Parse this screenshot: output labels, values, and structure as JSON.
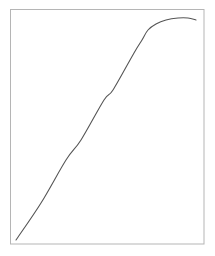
{
  "chart_data": {
    "type": "line",
    "title": "",
    "xlabel": "",
    "ylabel": "",
    "grid": false,
    "legend": null,
    "axis_ticks": "none",
    "description": "Single curve rising linearly from bottom-left, then bending over to a plateau with a slight drop near the right end",
    "series": [
      {
        "name": "curve",
        "color": "#555555",
        "points_px": [
          [
            16,
            240
          ],
          [
            41,
            203
          ],
          [
            66,
            160
          ],
          [
            81,
            140
          ],
          [
            104,
            100
          ],
          [
            113,
            90
          ],
          [
            134,
            53
          ],
          [
            142,
            40
          ],
          [
            148,
            30
          ],
          [
            156,
            24
          ],
          [
            166,
            20
          ],
          [
            178,
            18
          ],
          [
            188,
            18
          ],
          [
            196,
            20
          ]
        ],
        "points_normalized": [
          [
            0.03,
            0.02
          ],
          [
            0.16,
            0.17
          ],
          [
            0.29,
            0.36
          ],
          [
            0.36,
            0.44
          ],
          [
            0.48,
            0.61
          ],
          [
            0.53,
            0.66
          ],
          [
            0.63,
            0.82
          ],
          [
            0.68,
            0.87
          ],
          [
            0.71,
            0.91
          ],
          [
            0.75,
            0.94
          ],
          [
            0.8,
            0.96
          ],
          [
            0.86,
            0.97
          ],
          [
            0.91,
            0.97
          ],
          [
            0.95,
            0.96
          ]
        ]
      }
    ],
    "frame": {
      "color": "#b5b5b5",
      "left": 10.5,
      "top": 9.5,
      "right": 204,
      "bottom": 244
    }
  }
}
